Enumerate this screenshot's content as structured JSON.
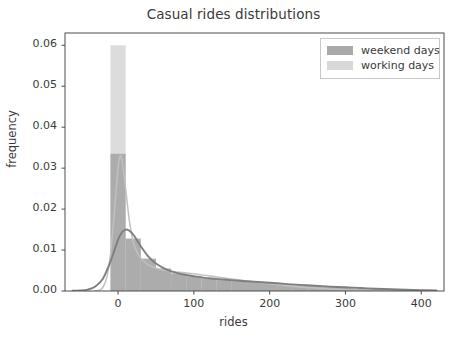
{
  "chart_data": {
    "type": "area",
    "title": "Casual rides distributions",
    "xlabel": "rides",
    "ylabel": "frequency",
    "xlim": [
      -70,
      430
    ],
    "ylim": [
      0.0,
      0.063
    ],
    "xticks": [
      0,
      100,
      200,
      300,
      400
    ],
    "xtick_labels": [
      "0",
      "100",
      "200",
      "300",
      "400"
    ],
    "yticks": [
      0.0,
      0.01,
      0.02,
      0.03,
      0.04,
      0.05,
      0.06
    ],
    "ytick_labels": [
      "0.00",
      "0.01",
      "0.02",
      "0.03",
      "0.04",
      "0.05",
      "0.06"
    ],
    "grid": false,
    "legend_position": "upper right",
    "series": [
      {
        "name": "weekend days",
        "color": "#a9a9a9",
        "line_color": "#7f7f7f",
        "hist_bin_width": 20,
        "hist_x": [
          0,
          20,
          40,
          60,
          80,
          100,
          120,
          140,
          160,
          180,
          200,
          220,
          240,
          260,
          280,
          300,
          320,
          340,
          360,
          380,
          400
        ],
        "hist_values": [
          0.0335,
          0.0128,
          0.0079,
          0.0055,
          0.0043,
          0.0036,
          0.0031,
          0.0028,
          0.0025,
          0.0022,
          0.0019,
          0.0016,
          0.0014,
          0.0012,
          0.001,
          0.0008,
          0.0006,
          0.0005,
          0.0004,
          0.0003,
          0.0002
        ],
        "kde_x": [
          -60,
          -50,
          -40,
          -30,
          -20,
          -10,
          0,
          5,
          10,
          15,
          20,
          25,
          30,
          40,
          50,
          60,
          70,
          80,
          90,
          100,
          120,
          140,
          160,
          180,
          200,
          220,
          240,
          260,
          280,
          300,
          320,
          340,
          360,
          380,
          400,
          420
        ],
        "kde_y": [
          5e-05,
          0.00012,
          0.00035,
          0.0011,
          0.003,
          0.0072,
          0.0125,
          0.0143,
          0.015,
          0.0147,
          0.0138,
          0.0124,
          0.0109,
          0.0084,
          0.0067,
          0.0056,
          0.0048,
          0.0043,
          0.0039,
          0.0036,
          0.0031,
          0.0028,
          0.0025,
          0.00225,
          0.002,
          0.00175,
          0.0015,
          0.00128,
          0.00108,
          0.0009,
          0.00072,
          0.00056,
          0.00042,
          0.0003,
          0.0002,
          0.00012
        ]
      },
      {
        "name": "working days",
        "color": "#d8d8d8",
        "line_color": "#c0c0c0",
        "hist_bin_width": 20,
        "hist_x": [
          0,
          20,
          40,
          60,
          80,
          100,
          120,
          140,
          160,
          180,
          200,
          220,
          240,
          260,
          280,
          300
        ],
        "hist_values": [
          0.06,
          0.01,
          0.0062,
          0.0048,
          0.0042,
          0.0038,
          0.0033,
          0.0028,
          0.0023,
          0.0018,
          0.0014,
          0.001,
          0.0007,
          0.0005,
          0.0003,
          0.0002
        ],
        "kde_x": [
          -30,
          -25,
          -20,
          -15,
          -10,
          -5,
          0,
          3,
          6,
          10,
          15,
          20,
          25,
          30,
          40,
          50,
          60,
          70,
          80,
          90,
          100,
          120,
          140,
          160,
          180,
          200,
          220,
          240,
          260,
          280,
          300,
          320,
          340,
          360
        ],
        "kde_y": [
          5e-05,
          0.0002,
          0.0009,
          0.0032,
          0.009,
          0.019,
          0.03,
          0.033,
          0.031,
          0.025,
          0.017,
          0.012,
          0.0095,
          0.008,
          0.0064,
          0.0056,
          0.0051,
          0.0048,
          0.0046,
          0.0044,
          0.0042,
          0.0037,
          0.0032,
          0.0027,
          0.0022,
          0.00175,
          0.00135,
          0.001,
          0.00072,
          0.0005,
          0.00033,
          0.0002,
          0.00011,
          5e-05
        ]
      }
    ]
  },
  "legend": {
    "items": [
      {
        "label": "weekend days",
        "color": "#a9a9a9"
      },
      {
        "label": "working days",
        "color": "#d8d8d8"
      }
    ]
  },
  "axes": {
    "frame_color": "#4d4d4d"
  }
}
